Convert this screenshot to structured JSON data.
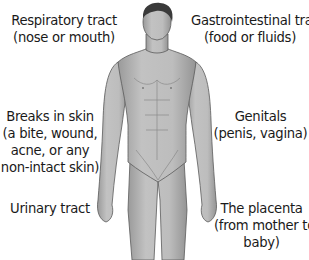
{
  "labels": {
    "respiratory": {
      "line1": "Respiratory tract",
      "line2": "(nose or mouth)"
    },
    "gastrointestinal": {
      "line1": "Gastrointestinal tract",
      "line2": "(food or fluids)"
    },
    "skin": {
      "line1": "Breaks in skin",
      "line2": "(a bite, wound,",
      "line3": "acne, or any",
      "line4": "non-intact skin)"
    },
    "genitals": {
      "line1": "Genitals",
      "line2": "(penis, vagina)"
    },
    "urinary": {
      "line1": "Urinary tract"
    },
    "placenta": {
      "line1": "The placenta",
      "line2": "(from mother to",
      "line3": "baby)"
    }
  },
  "colors": {
    "skin": "#b8b8b8",
    "skin_shadow": "#8e8e8e",
    "hair": "#3a3a3a",
    "outline": "#5a5a5a",
    "text": "#1a1a1a"
  }
}
